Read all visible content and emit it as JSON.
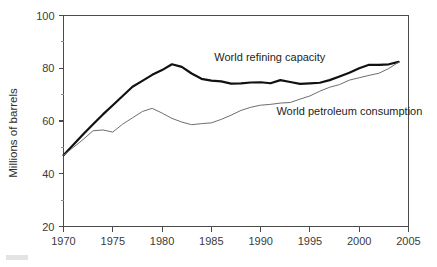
{
  "chart_data": {
    "type": "line",
    "title": "",
    "xlabel": "",
    "ylabel": "Millions of barrels",
    "xlim": [
      1970,
      2005
    ],
    "ylim": [
      20,
      100
    ],
    "grid": false,
    "legend_position": "inline-annotation",
    "x_ticks": [
      1970,
      1975,
      1980,
      1985,
      1990,
      1995,
      2000,
      2005
    ],
    "x_tick_labels": [
      "1970",
      "1975",
      "1980",
      "1985",
      "1990",
      "1995",
      "2000",
      "2005"
    ],
    "x_minor_ticks": [],
    "y_ticks": [
      20,
      40,
      60,
      80,
      100
    ],
    "y_tick_labels": [
      "20",
      "40",
      "60",
      "80",
      "100"
    ],
    "y_minor_ticks": [
      30,
      50,
      70,
      90
    ],
    "x": [
      1970,
      1971,
      1972,
      1973,
      1974,
      1975,
      1976,
      1977,
      1978,
      1979,
      1980,
      1981,
      1982,
      1983,
      1984,
      1985,
      1986,
      1987,
      1988,
      1989,
      1990,
      1991,
      1992,
      1993,
      1994,
      1995,
      1996,
      1997,
      1998,
      1999,
      2000,
      2001,
      2002,
      2003,
      2004
    ],
    "series": [
      {
        "name": "World refining capacity",
        "style": "thick-black",
        "color": "#111111",
        "label_x": 1985.3,
        "label_y": 82.6,
        "values": [
          47.0,
          51.0,
          55.0,
          58.8,
          62.5,
          66.0,
          69.5,
          73.0,
          75.2,
          77.5,
          79.3,
          81.5,
          80.5,
          78.0,
          76.0,
          75.3,
          75.0,
          74.2,
          74.3,
          74.6,
          74.7,
          74.3,
          75.5,
          74.8,
          74.1,
          74.3,
          74.5,
          75.5,
          76.9,
          78.3,
          80.0,
          81.3,
          81.3,
          81.5,
          82.4
        ]
      },
      {
        "name": "World petroleum consumption",
        "style": "thin-gray",
        "color": "#6e6e6e",
        "label_x": 1991.6,
        "label_y": 62.1,
        "values": [
          47.0,
          50.0,
          53.0,
          56.3,
          56.6,
          55.8,
          58.8,
          61.2,
          63.6,
          64.8,
          63.0,
          61.0,
          59.6,
          58.6,
          59.0,
          59.3,
          60.6,
          62.2,
          64.0,
          65.2,
          66.0,
          66.3,
          66.8,
          67.0,
          68.3,
          69.5,
          71.3,
          72.8,
          73.8,
          75.5,
          76.4,
          77.3,
          78.1,
          79.9,
          82.3
        ]
      }
    ]
  },
  "annotations": {
    "refining": "World refining capacity",
    "consumption": "World petroleum consumption"
  },
  "axes": {
    "y_title": "Millions of barrels"
  }
}
